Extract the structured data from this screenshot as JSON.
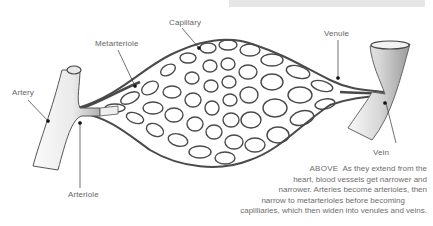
{
  "labels": {
    "capillary": "Capillary",
    "metarteriole": "Metarteriole",
    "venule": "Venule",
    "artery": "Artery",
    "vein": "Vein",
    "arteriole": "Arteriole"
  },
  "caption": {
    "lead": "ABOVE",
    "lines": [
      "As they extend from the",
      "heart, blood vessels get narrower and",
      "narrower. Arteries become arterioles, then",
      "narrow to metarterioles before becoming",
      "capilliaries, which then widen into venules and veins."
    ]
  },
  "colors": {
    "label_text": "#666666",
    "vessel_outline": "#4a4a4a",
    "vessel_fill": "#f4f4f4",
    "top_bar": "#e6e6e6"
  }
}
